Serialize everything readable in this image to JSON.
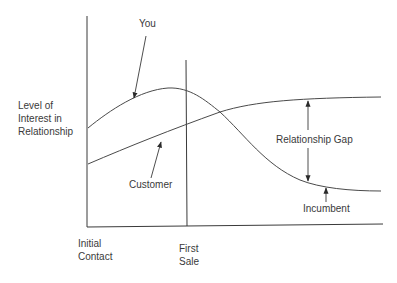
{
  "diagram": {
    "type": "line-diagram",
    "y_axis_label": [
      "Level of",
      "Interest in",
      "Relationship"
    ],
    "x_axis_labels": {
      "start": [
        "Initial",
        "Contact"
      ],
      "marker": [
        "First",
        "Sale"
      ]
    },
    "curves": [
      {
        "name": "You",
        "label": "You",
        "trend": "rises to a peak near First Sale, then declines sharply"
      },
      {
        "name": "Customer",
        "label": "Customer",
        "trend": "rises steadily, then levels off high"
      },
      {
        "name": "Incumbent",
        "label": "Incumbent",
        "trend": "the 'You' curve after decline, leveling off low"
      }
    ],
    "annotations": {
      "you": "You",
      "customer": "Customer",
      "gap": "Relationship Gap",
      "incumbent": "Incumbent"
    },
    "colors": {
      "ink": "#3a3a3a",
      "background": "#ffffff"
    }
  }
}
